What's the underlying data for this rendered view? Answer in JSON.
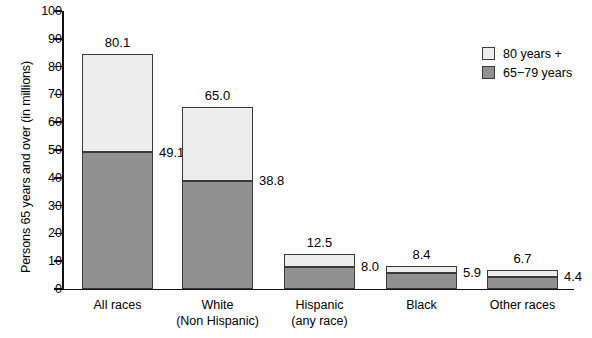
{
  "chart_data": {
    "type": "bar",
    "subtype": "stacked-vertical",
    "title": "",
    "xlabel": "",
    "ylabel": "Persons 65 years and over (in millions)",
    "ylim": [
      0,
      100
    ],
    "yticks": [
      0,
      10,
      20,
      30,
      40,
      50,
      60,
      70,
      80,
      90,
      100
    ],
    "ytick_labels": [
      "0",
      "10",
      "20",
      "30",
      "40",
      "50",
      "60",
      "70",
      "80",
      "90",
      "100"
    ],
    "grid": false,
    "legend_position": "top-right",
    "categories": [
      "All races",
      "White\n(Non Hispanic)",
      "Hispanic\n(any race)",
      "Black",
      "Other races"
    ],
    "category_lines": [
      [
        "All races"
      ],
      [
        "White",
        "(Non Hispanic)"
      ],
      [
        "Hispanic",
        "(any race)"
      ],
      [
        "Black"
      ],
      [
        "Other races"
      ]
    ],
    "series": [
      {
        "name": "65−79 years",
        "color": "#919191",
        "values": [
          49.1,
          38.8,
          8.0,
          5.9,
          4.4
        ],
        "labels": [
          "49.1",
          "38.8",
          "8.0",
          "5.9",
          "4.4"
        ]
      },
      {
        "name": "80 years +",
        "color": "#ededed",
        "values": [
          35.4,
          26.7,
          4.5,
          2.5,
          2.3
        ],
        "labels": [
          "",
          "",
          "",
          "",
          ""
        ]
      }
    ],
    "totals": [
      84.5,
      65.5,
      12.5,
      8.4,
      6.7
    ],
    "total_labels": [
      "80.1",
      "65.0",
      "12.5",
      "8.4",
      "6.7"
    ],
    "legend": [
      {
        "label": "80 years +",
        "color": "#ededed"
      },
      {
        "label": "65−79 years",
        "color": "#919191"
      }
    ],
    "axis_color": "#111111",
    "bar_border_color": "#3a3a3a"
  }
}
